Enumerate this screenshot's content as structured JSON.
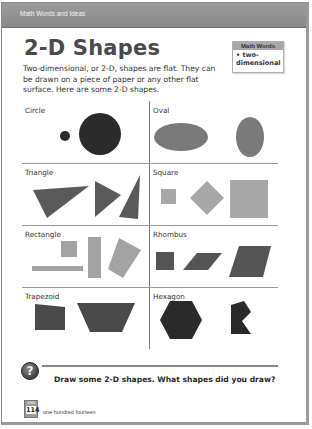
{
  "header": {
    "band_label": "Math Words and Ideas"
  },
  "title": "2-D Shapes",
  "intro": "Two-dimensional, or 2-D, shapes are flat. They can be drawn on a piece of paper or any other flat surface. Here are some 2-D shapes.",
  "math_words_box": {
    "heading": "Math Words",
    "items": [
      "• two-dimensional"
    ]
  },
  "shapes": [
    {
      "label": "Circle",
      "color": "#2b2b2b"
    },
    {
      "label": "Oval",
      "color": "#7a7a7a"
    },
    {
      "label": "Triangle",
      "color": "#5a5a5a"
    },
    {
      "label": "Square",
      "color": "#a8a8a8"
    },
    {
      "label": "Rectangle",
      "color": "#a3a3a3"
    },
    {
      "label": "Rhombus",
      "color": "#555555"
    },
    {
      "label": "Trapezoid",
      "color": "#4a4a4a"
    },
    {
      "label": "Hexagon",
      "color": "#2a2a2a"
    }
  ],
  "question": {
    "icon": "?",
    "text": "Draw some 2-D shapes. What shapes did you draw?"
  },
  "footer": {
    "badge_small": "SMB",
    "page_number": "114",
    "page_words": "one hundred fourteen"
  }
}
